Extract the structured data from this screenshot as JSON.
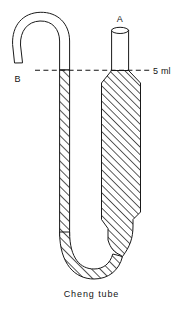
{
  "figure": {
    "caption": "Cheng tube",
    "labels": {
      "port_a": "A",
      "port_b": "B",
      "volume_mark": "5 ml"
    },
    "colors": {
      "ink": "#1a1a1a",
      "background": "#ffffff",
      "hatch": "#1a1a1a"
    },
    "diagram_elements": {
      "arm_left_name": "B",
      "arm_right_name": "A",
      "level_marker_value": "5 ml",
      "shape": "U-tube"
    }
  }
}
